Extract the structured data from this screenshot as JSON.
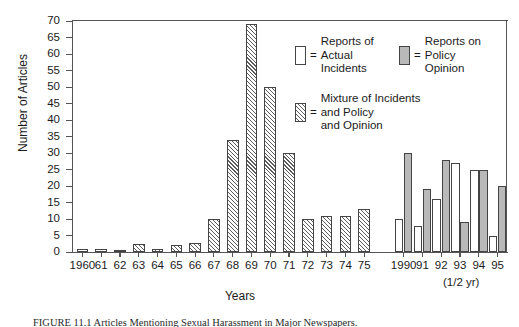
{
  "figure": {
    "caption": "FIGURE 11.1   Articles Mentioning Sexual Harassment in Major Newspapers."
  },
  "chart_data": {
    "type": "bar",
    "title": "",
    "xlabel": "Years",
    "ylabel": "Number of Articles",
    "ylim": [
      0,
      70
    ],
    "ytick_step": 5,
    "yticks": [
      0,
      5,
      10,
      15,
      20,
      25,
      30,
      35,
      40,
      45,
      50,
      55,
      60,
      65,
      70
    ],
    "grid": false,
    "legend_position": "inside-top-right",
    "note": "(1/2 yr)",
    "categories": [
      "1960",
      "61",
      "62",
      "63",
      "64",
      "65",
      "66",
      "67",
      "68",
      "69",
      "70",
      "71",
      "72",
      "73",
      "74",
      "75",
      "1990",
      "91",
      "92",
      "93",
      "94",
      "95"
    ],
    "series": [
      {
        "name": "Reports of Actual Incidents",
        "style": "white",
        "color": "#ffffff",
        "values": [
          1,
          1,
          0.6,
          0,
          1,
          0,
          0,
          0,
          0,
          0,
          0,
          0,
          0,
          0,
          0,
          0,
          10,
          8,
          16,
          27,
          25,
          5
        ]
      },
      {
        "name": "Reports on Policy Opinion",
        "style": "gray",
        "color": "#b9b9b9",
        "values": [
          0,
          0,
          0,
          0,
          0,
          0,
          0,
          0,
          0,
          0,
          0,
          0,
          0,
          0,
          0,
          0,
          30,
          19,
          28,
          9,
          25,
          20
        ]
      },
      {
        "name": "Mixture of Incidents and Policy and Opinion",
        "style": "hatch",
        "color": "#ffffff",
        "values": [
          0,
          0,
          0,
          2.5,
          1,
          2.2,
          2.6,
          10,
          34,
          69,
          50,
          30,
          10,
          11,
          11,
          13,
          0,
          0,
          0,
          0,
          0,
          0
        ]
      }
    ]
  },
  "legend": {
    "actual": {
      "equals": "=",
      "label": "Reports of\nActual\nIncidents",
      "swatch": "white"
    },
    "policy": {
      "equals": "=",
      "label": "Reports on\nPolicy\nOpinion",
      "swatch": "gray"
    },
    "mixture": {
      "equals": "=",
      "label": "Mixture of Incidents\nand Policy\nand Opinion",
      "swatch": "hatch"
    }
  }
}
